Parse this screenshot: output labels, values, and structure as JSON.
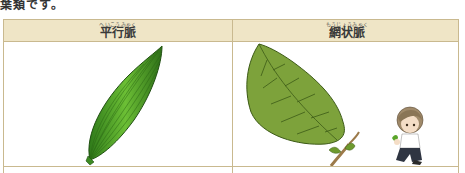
{
  "page": {
    "top_text": "葉類です。"
  },
  "table": {
    "columns": [
      {
        "ruby": "へいこうみゃく",
        "term": "平行脈",
        "image": "parallel-vein-leaf"
      },
      {
        "ruby": "もうじょうみゃく",
        "term": "網状脈",
        "image": "net-vein-leaf"
      }
    ],
    "colors": {
      "header_bg": "#efe5c6",
      "border": "#c9b98f",
      "leaf_parallel": "#4f9a2a",
      "leaf_net": "#7fa03a"
    }
  }
}
